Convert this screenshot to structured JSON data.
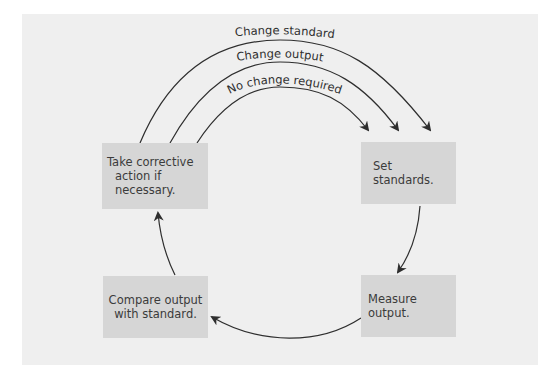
{
  "diagram": {
    "type": "control-process-cycle",
    "colors": {
      "panel": "#efefef",
      "box": "#d6d6d6",
      "text": "#3b3b3b",
      "line": "#2e2e2e"
    },
    "steps": [
      {
        "id": "set-standards",
        "label": "Set standards."
      },
      {
        "id": "measure-output",
        "label": "Measure output."
      },
      {
        "id": "compare-output",
        "label_line1": "Compare output",
        "label_line2": "with standard."
      },
      {
        "id": "take-corrective-action",
        "label_line1": "Take corrective",
        "label_line2": "action if necessary."
      }
    ],
    "feedback_arcs": [
      {
        "label": "Change standard"
      },
      {
        "label": "Change output"
      },
      {
        "label": "No change required"
      }
    ]
  }
}
